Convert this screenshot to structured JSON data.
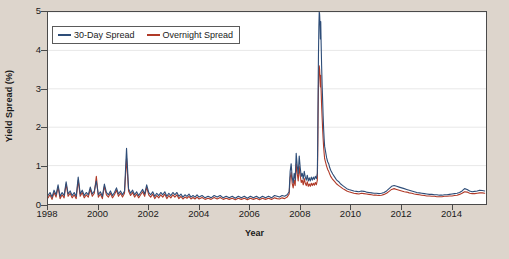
{
  "chart_data": {
    "type": "line",
    "title": "",
    "xlabel": "Year",
    "ylabel": "Yield Spread (%)",
    "xlim": [
      1998,
      2015.4
    ],
    "ylim": [
      0,
      5
    ],
    "xticks": [
      1998,
      2000,
      2002,
      2004,
      2006,
      2008,
      2010,
      2012,
      2014
    ],
    "xticklabels": [
      "1998",
      "2000",
      "2002",
      "2004",
      "2006",
      "2008",
      "2010",
      "2012",
      "2014"
    ],
    "yticks": [
      0,
      1,
      2,
      3,
      4,
      5
    ],
    "yticklabels": [
      "0",
      "1",
      "2",
      "3",
      "4",
      "5"
    ],
    "grid": true,
    "grid_axis": "y",
    "legend_position": "upper left",
    "series": [
      {
        "name": "30-Day Spread",
        "color": "#2e4d78",
        "x": [
          1998.0,
          1998.08,
          1998.16,
          1998.24,
          1998.32,
          1998.4,
          1998.48,
          1998.56,
          1998.64,
          1998.72,
          1998.8,
          1998.88,
          1998.96,
          1999.04,
          1999.12,
          1999.2,
          1999.28,
          1999.36,
          1999.44,
          1999.52,
          1999.6,
          1999.68,
          1999.76,
          1999.84,
          1999.92,
          2000.0,
          2000.08,
          2000.16,
          2000.24,
          2000.32,
          2000.4,
          2000.48,
          2000.56,
          2000.64,
          2000.72,
          2000.8,
          2000.88,
          2000.96,
          2001.04,
          2001.12,
          2001.2,
          2001.28,
          2001.36,
          2001.44,
          2001.52,
          2001.6,
          2001.68,
          2001.76,
          2001.84,
          2001.92,
          2002.0,
          2002.08,
          2002.16,
          2002.24,
          2002.32,
          2002.4,
          2002.48,
          2002.56,
          2002.64,
          2002.72,
          2002.8,
          2002.88,
          2002.96,
          2003.04,
          2003.12,
          2003.2,
          2003.28,
          2003.36,
          2003.44,
          2003.52,
          2003.6,
          2003.68,
          2003.76,
          2003.84,
          2003.92,
          2004.0,
          2004.12,
          2004.24,
          2004.36,
          2004.48,
          2004.6,
          2004.72,
          2004.84,
          2004.96,
          2005.08,
          2005.2,
          2005.32,
          2005.44,
          2005.56,
          2005.68,
          2005.8,
          2005.92,
          2006.04,
          2006.16,
          2006.28,
          2006.4,
          2006.52,
          2006.64,
          2006.76,
          2006.88,
          2007.0,
          2007.1,
          2007.2,
          2007.3,
          2007.4,
          2007.5,
          2007.58,
          2007.62,
          2007.66,
          2007.7,
          2007.74,
          2007.78,
          2007.82,
          2007.86,
          2007.9,
          2007.94,
          2007.98,
          2008.02,
          2008.06,
          2008.1,
          2008.14,
          2008.18,
          2008.22,
          2008.26,
          2008.3,
          2008.34,
          2008.38,
          2008.42,
          2008.46,
          2008.5,
          2008.54,
          2008.58,
          2008.62,
          2008.66,
          2008.7,
          2008.715,
          2008.73,
          2008.745,
          2008.76,
          2008.775,
          2008.79,
          2008.805,
          2008.82,
          2008.835,
          2008.85,
          2008.87,
          2008.89,
          2008.91,
          2008.93,
          2008.95,
          2008.97,
          2008.99,
          2009.03,
          2009.07,
          2009.11,
          2009.15,
          2009.19,
          2009.23,
          2009.31,
          2009.39,
          2009.47,
          2009.55,
          2009.63,
          2009.71,
          2009.79,
          2009.87,
          2009.95,
          2010.05,
          2010.15,
          2010.25,
          2010.35,
          2010.45,
          2010.55,
          2010.65,
          2010.75,
          2010.85,
          2010.95,
          2011.05,
          2011.15,
          2011.25,
          2011.35,
          2011.45,
          2011.55,
          2011.65,
          2011.75,
          2011.85,
          2011.95,
          2012.05,
          2012.15,
          2012.25,
          2012.35,
          2012.45,
          2012.55,
          2012.65,
          2012.75,
          2012.85,
          2012.95,
          2013.05,
          2013.15,
          2013.25,
          2013.35,
          2013.45,
          2013.55,
          2013.65,
          2013.75,
          2013.85,
          2013.95,
          2014.05,
          2014.15,
          2014.25,
          2014.35,
          2014.45,
          2014.55,
          2014.65,
          2014.75,
          2014.85,
          2014.95,
          2015.05,
          2015.15,
          2015.25,
          2015.35
        ],
        "y": [
          0.22,
          0.3,
          0.18,
          0.36,
          0.24,
          0.5,
          0.2,
          0.3,
          0.22,
          0.58,
          0.26,
          0.34,
          0.22,
          0.3,
          0.2,
          0.7,
          0.26,
          0.36,
          0.22,
          0.3,
          0.24,
          0.44,
          0.26,
          0.34,
          0.6,
          0.24,
          0.32,
          0.2,
          0.52,
          0.3,
          0.24,
          0.34,
          0.22,
          0.3,
          0.42,
          0.26,
          0.34,
          0.24,
          0.34,
          1.45,
          0.4,
          0.28,
          0.36,
          0.24,
          0.32,
          0.22,
          0.3,
          0.38,
          0.26,
          0.5,
          0.3,
          0.24,
          0.32,
          0.2,
          0.28,
          0.22,
          0.3,
          0.24,
          0.32,
          0.2,
          0.28,
          0.22,
          0.3,
          0.24,
          0.3,
          0.2,
          0.26,
          0.18,
          0.24,
          0.2,
          0.26,
          0.18,
          0.22,
          0.18,
          0.24,
          0.18,
          0.22,
          0.16,
          0.2,
          0.16,
          0.22,
          0.18,
          0.22,
          0.16,
          0.2,
          0.16,
          0.2,
          0.15,
          0.2,
          0.16,
          0.2,
          0.15,
          0.2,
          0.16,
          0.2,
          0.15,
          0.2,
          0.16,
          0.2,
          0.16,
          0.22,
          0.2,
          0.18,
          0.22,
          0.2,
          0.24,
          0.32,
          0.85,
          1.05,
          0.7,
          0.55,
          0.8,
          0.62,
          1.32,
          1.0,
          0.78,
          1.25,
          0.95,
          0.72,
          0.8,
          0.65,
          0.85,
          0.7,
          0.62,
          0.75,
          0.6,
          0.68,
          0.6,
          0.7,
          0.62,
          0.7,
          0.64,
          0.72,
          0.66,
          0.8,
          1.6,
          2.9,
          3.9,
          4.6,
          5.0,
          4.95,
          4.7,
          4.3,
          4.75,
          4.2,
          3.6,
          3.1,
          2.7,
          2.3,
          1.95,
          1.7,
          1.5,
          1.35,
          1.2,
          1.1,
          1.05,
          0.95,
          0.88,
          0.78,
          0.7,
          0.62,
          0.58,
          0.52,
          0.48,
          0.44,
          0.4,
          0.38,
          0.36,
          0.34,
          0.33,
          0.32,
          0.34,
          0.33,
          0.31,
          0.3,
          0.29,
          0.28,
          0.28,
          0.27,
          0.28,
          0.3,
          0.34,
          0.4,
          0.46,
          0.48,
          0.46,
          0.44,
          0.42,
          0.4,
          0.38,
          0.36,
          0.34,
          0.32,
          0.3,
          0.29,
          0.28,
          0.27,
          0.26,
          0.25,
          0.25,
          0.24,
          0.24,
          0.23,
          0.23,
          0.24,
          0.24,
          0.25,
          0.26,
          0.27,
          0.28,
          0.3,
          0.34,
          0.4,
          0.38,
          0.34,
          0.32,
          0.33,
          0.34,
          0.36,
          0.35,
          0.34
        ]
      },
      {
        "name": "Overnight Spread",
        "color": "#b03a28",
        "x": [
          1998.0,
          1998.08,
          1998.16,
          1998.24,
          1998.32,
          1998.4,
          1998.48,
          1998.56,
          1998.64,
          1998.72,
          1998.8,
          1998.88,
          1998.96,
          1999.04,
          1999.12,
          1999.2,
          1999.28,
          1999.36,
          1999.44,
          1999.52,
          1999.6,
          1999.68,
          1999.76,
          1999.84,
          1999.92,
          2000.0,
          2000.08,
          2000.16,
          2000.24,
          2000.32,
          2000.4,
          2000.48,
          2000.56,
          2000.64,
          2000.72,
          2000.8,
          2000.88,
          2000.96,
          2001.04,
          2001.12,
          2001.2,
          2001.28,
          2001.36,
          2001.44,
          2001.52,
          2001.6,
          2001.68,
          2001.76,
          2001.84,
          2001.92,
          2002.0,
          2002.08,
          2002.16,
          2002.24,
          2002.32,
          2002.4,
          2002.48,
          2002.56,
          2002.64,
          2002.72,
          2002.8,
          2002.88,
          2002.96,
          2003.04,
          2003.12,
          2003.2,
          2003.28,
          2003.36,
          2003.44,
          2003.52,
          2003.6,
          2003.68,
          2003.76,
          2003.84,
          2003.92,
          2004.0,
          2004.12,
          2004.24,
          2004.36,
          2004.48,
          2004.6,
          2004.72,
          2004.84,
          2004.96,
          2005.08,
          2005.2,
          2005.32,
          2005.44,
          2005.56,
          2005.68,
          2005.8,
          2005.92,
          2006.04,
          2006.16,
          2006.28,
          2006.4,
          2006.52,
          2006.64,
          2006.76,
          2006.88,
          2007.0,
          2007.1,
          2007.2,
          2007.3,
          2007.4,
          2007.5,
          2007.58,
          2007.62,
          2007.66,
          2007.7,
          2007.74,
          2007.78,
          2007.82,
          2007.86,
          2007.9,
          2007.94,
          2007.98,
          2008.02,
          2008.06,
          2008.1,
          2008.14,
          2008.18,
          2008.22,
          2008.26,
          2008.3,
          2008.34,
          2008.38,
          2008.42,
          2008.46,
          2008.5,
          2008.54,
          2008.58,
          2008.62,
          2008.66,
          2008.7,
          2008.715,
          2008.73,
          2008.745,
          2008.76,
          2008.775,
          2008.79,
          2008.805,
          2008.82,
          2008.835,
          2008.85,
          2008.87,
          2008.89,
          2008.91,
          2008.93,
          2008.95,
          2008.97,
          2008.99,
          2009.03,
          2009.07,
          2009.11,
          2009.15,
          2009.19,
          2009.23,
          2009.31,
          2009.39,
          2009.47,
          2009.55,
          2009.63,
          2009.71,
          2009.79,
          2009.87,
          2009.95,
          2010.05,
          2010.15,
          2010.25,
          2010.35,
          2010.45,
          2010.55,
          2010.65,
          2010.75,
          2010.85,
          2010.95,
          2011.05,
          2011.15,
          2011.25,
          2011.35,
          2011.45,
          2011.55,
          2011.65,
          2011.75,
          2011.85,
          2011.95,
          2012.05,
          2012.15,
          2012.25,
          2012.35,
          2012.45,
          2012.55,
          2012.65,
          2012.75,
          2012.85,
          2012.95,
          2013.05,
          2013.15,
          2013.25,
          2013.35,
          2013.45,
          2013.55,
          2013.65,
          2013.75,
          2013.85,
          2013.95,
          2014.05,
          2014.15,
          2014.25,
          2014.35,
          2014.45,
          2014.55,
          2014.65,
          2014.75,
          2014.85,
          2014.95,
          2015.05,
          2015.15,
          2015.25,
          2015.35
        ],
        "y": [
          0.16,
          0.24,
          0.12,
          0.3,
          0.18,
          0.44,
          0.14,
          0.24,
          0.16,
          0.52,
          0.2,
          0.28,
          0.16,
          0.24,
          0.14,
          0.62,
          0.2,
          0.3,
          0.16,
          0.24,
          0.18,
          0.38,
          0.2,
          0.28,
          0.72,
          0.18,
          0.26,
          0.14,
          0.46,
          0.24,
          0.18,
          0.28,
          0.16,
          0.24,
          0.36,
          0.2,
          0.28,
          0.18,
          0.28,
          1.2,
          0.34,
          0.22,
          0.3,
          0.18,
          0.26,
          0.16,
          0.24,
          0.32,
          0.2,
          0.44,
          0.24,
          0.18,
          0.26,
          0.14,
          0.22,
          0.16,
          0.24,
          0.18,
          0.26,
          0.14,
          0.22,
          0.16,
          0.24,
          0.18,
          0.24,
          0.14,
          0.2,
          0.13,
          0.18,
          0.15,
          0.2,
          0.13,
          0.17,
          0.13,
          0.18,
          0.13,
          0.17,
          0.12,
          0.15,
          0.12,
          0.17,
          0.13,
          0.17,
          0.12,
          0.15,
          0.12,
          0.15,
          0.11,
          0.15,
          0.12,
          0.15,
          0.11,
          0.15,
          0.12,
          0.15,
          0.11,
          0.15,
          0.12,
          0.15,
          0.12,
          0.16,
          0.14,
          0.13,
          0.16,
          0.14,
          0.18,
          0.26,
          0.68,
          0.82,
          0.54,
          0.42,
          0.62,
          0.48,
          1.05,
          0.8,
          0.6,
          0.98,
          0.74,
          0.56,
          0.62,
          0.5,
          0.66,
          0.54,
          0.48,
          0.58,
          0.46,
          0.52,
          0.46,
          0.54,
          0.48,
          0.54,
          0.49,
          0.56,
          0.5,
          0.62,
          1.3,
          2.3,
          3.05,
          3.45,
          3.6,
          3.5,
          3.3,
          3.05,
          3.35,
          2.95,
          2.55,
          2.25,
          1.95,
          1.7,
          1.48,
          1.32,
          1.18,
          1.08,
          0.98,
          0.9,
          0.85,
          0.78,
          0.72,
          0.64,
          0.58,
          0.52,
          0.48,
          0.44,
          0.4,
          0.37,
          0.34,
          0.32,
          0.3,
          0.28,
          0.27,
          0.26,
          0.28,
          0.27,
          0.26,
          0.25,
          0.24,
          0.23,
          0.23,
          0.22,
          0.23,
          0.25,
          0.28,
          0.33,
          0.38,
          0.4,
          0.38,
          0.36,
          0.34,
          0.32,
          0.31,
          0.29,
          0.28,
          0.26,
          0.25,
          0.24,
          0.23,
          0.22,
          0.21,
          0.21,
          0.2,
          0.2,
          0.19,
          0.19,
          0.19,
          0.2,
          0.2,
          0.21,
          0.21,
          0.22,
          0.23,
          0.25,
          0.28,
          0.32,
          0.31,
          0.28,
          0.27,
          0.27,
          0.28,
          0.29,
          0.29,
          0.28
        ]
      }
    ]
  },
  "legend": {
    "items": [
      {
        "label": "30-Day Spread",
        "color": "#2e4d78"
      },
      {
        "label": "Overnight Spread",
        "color": "#b03a28"
      }
    ]
  },
  "axes": {
    "y_title": "Yield Spread (%)",
    "x_title": "Year",
    "y_ticks": [
      "0",
      "1",
      "2",
      "3",
      "4",
      "5"
    ],
    "x_ticks": [
      "1998",
      "2000",
      "2002",
      "2004",
      "2006",
      "2008",
      "2010",
      "2012",
      "2014"
    ]
  },
  "colors": {
    "page_background": "#ddd5cc",
    "plot_background": "#ffffff",
    "axis": "#4a4a4a",
    "grid": "#e8e8e8",
    "series_30day": "#2e4d78",
    "series_overnight": "#b03a28"
  }
}
